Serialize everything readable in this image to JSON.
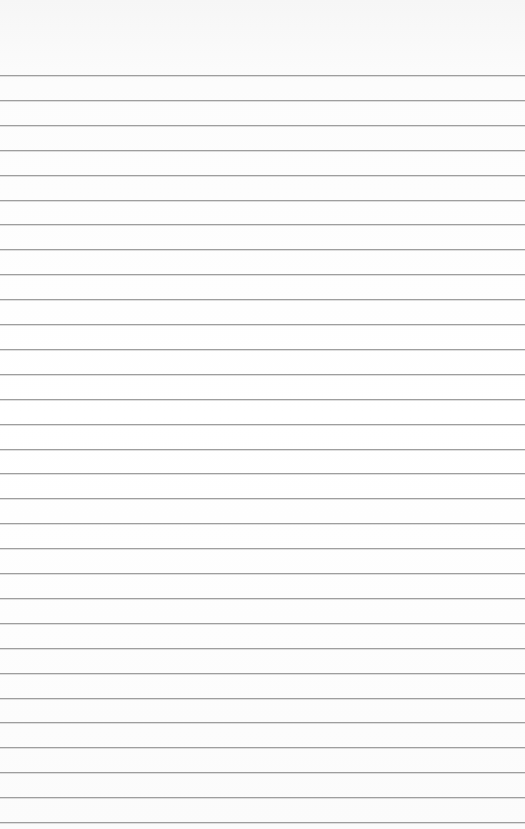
{
  "page": {
    "type": "lined-paper",
    "background_color": "#ffffff",
    "rule_color": "#9e9e9e",
    "first_rule_y": 75,
    "rule_spacing": 24.9,
    "rule_count": 31
  }
}
